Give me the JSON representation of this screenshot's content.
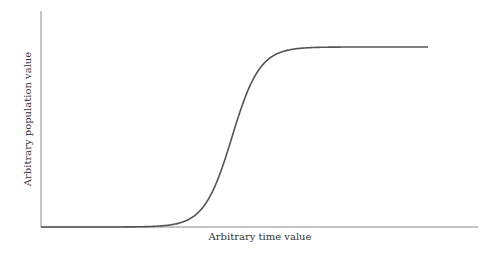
{
  "chart_data": {
    "type": "line",
    "title": "",
    "xlabel": "Arbitrary time value",
    "ylabel": "Arbitrary population value",
    "grid": false,
    "legend": null,
    "xlim": [
      0,
      10
    ],
    "ylim": [
      0,
      1.2
    ],
    "series": [
      {
        "name": "logistic growth",
        "x": [
          0,
          1,
          2,
          3,
          3.5,
          4,
          4.5,
          5,
          5.5,
          6,
          6.5,
          7,
          8,
          9,
          10
        ],
        "values": [
          0.0,
          0.0,
          0.001,
          0.02,
          0.07,
          0.22,
          0.5,
          0.78,
          0.93,
          0.98,
          0.995,
          1.0,
          1.0,
          1.0,
          1.0
        ]
      }
    ],
    "colors": {
      "curve": "#555555",
      "axis": "#8a8a8a"
    }
  }
}
